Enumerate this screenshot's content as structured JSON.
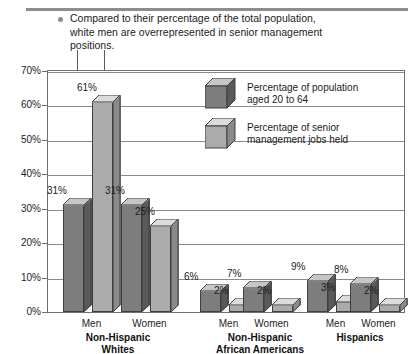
{
  "caption": {
    "bullet_icon": "bullet-dot",
    "text": "Compared to their percentage of the total population, white men are overrepresented in senior management positions."
  },
  "legend": {
    "position": "inside-top-right",
    "items": [
      {
        "label": "Percentage of population\naged 20 to 64",
        "color": "#7d7d7d",
        "icon": "cube-icon-dark"
      },
      {
        "label": "Percentage of senior\nmanagement jobs held",
        "color": "#ababab",
        "icon": "cube-icon-light"
      }
    ]
  },
  "axis": {
    "y_ticks": [
      "0%",
      "10%",
      "20%",
      "30%",
      "40%",
      "50%",
      "60%",
      "70%"
    ],
    "y_min": 0,
    "y_max": 70
  },
  "colors": {
    "series_dark": "#7d7d7d",
    "series_dark_top": "#c6c6c6",
    "series_dark_side": "#5a5a5a",
    "series_light": "#ababab",
    "series_light_top": "#dcdcdc",
    "series_light_side": "#8a8a8a",
    "gridline": "#8a8a8a",
    "frame": "#6f6f6f",
    "rule": "#8d8d8d"
  },
  "chart_data": {
    "type": "bar",
    "title": "",
    "subtitle": "",
    "xlabel": "",
    "ylabel": "",
    "ylim": [
      0,
      70
    ],
    "grid": true,
    "legend_position": "inside-top-right",
    "categories": [
      "Non-Hispanic Whites — Men",
      "Non-Hispanic Whites — Women",
      "Non-Hispanic African Americans — Men",
      "Non-Hispanic African Americans — Women",
      "Hispanics — Men",
      "Hispanics — Women"
    ],
    "groups": [
      {
        "group_label": "Non-Hispanic\nWhites",
        "group_label_line1": "Non-Hispanic",
        "group_label_line2": "Whites",
        "bars": [
          {
            "gender": "Men",
            "population": 31,
            "management": 61,
            "population_label": "31%",
            "management_label": "61%"
          },
          {
            "gender": "Women",
            "population": 31,
            "management": 25,
            "population_label": "31%",
            "management_label": "25%"
          }
        ]
      },
      {
        "group_label": "Non-Hispanic\nAfrican Americans",
        "group_label_line1": "Non-Hispanic",
        "group_label_line2": "African Americans",
        "bars": [
          {
            "gender": "Men",
            "population": 6,
            "management": 2,
            "population_label": "6%",
            "management_label": "2%"
          },
          {
            "gender": "Women",
            "population": 7,
            "management": 2,
            "population_label": "7%",
            "management_label": "2%"
          }
        ]
      },
      {
        "group_label": "Hispanics",
        "group_label_line1": "Hispanics",
        "group_label_line2": "",
        "bars": [
          {
            "gender": "Men",
            "population": 9,
            "management": 3,
            "population_label": "9%",
            "management_label": "3%"
          },
          {
            "gender": "Women",
            "population": 8,
            "management": 2,
            "population_label": "8%",
            "management_label": "2%"
          }
        ]
      }
    ],
    "series": [
      {
        "name": "Percentage of population aged 20 to 64",
        "values": [
          31,
          31,
          6,
          7,
          9,
          8
        ]
      },
      {
        "name": "Percentage of senior management jobs held",
        "values": [
          61,
          25,
          2,
          2,
          3,
          2
        ]
      }
    ]
  }
}
